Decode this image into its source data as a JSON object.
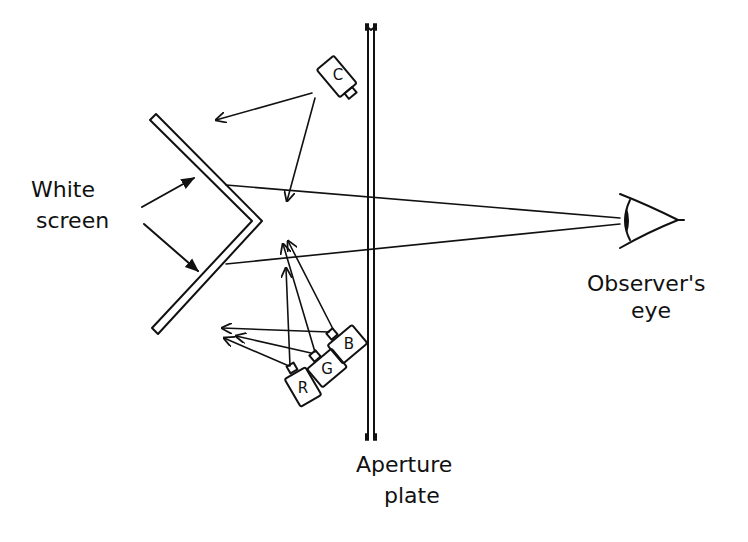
{
  "diagram": {
    "type": "optical apparatus schematic",
    "labels": {
      "white_screen_line1": "White",
      "white_screen_line2": "screen",
      "aperture_line1": "Aperture",
      "aperture_line2": "plate",
      "observer_line1": "Observer's",
      "observer_line2": "eye"
    },
    "projectors": [
      {
        "id": "C",
        "label": "C"
      },
      {
        "id": "B",
        "label": "B"
      },
      {
        "id": "G",
        "label": "G"
      },
      {
        "id": "R",
        "label": "R"
      }
    ],
    "colors": {
      "ink": "#111111",
      "background": "#ffffff"
    }
  }
}
